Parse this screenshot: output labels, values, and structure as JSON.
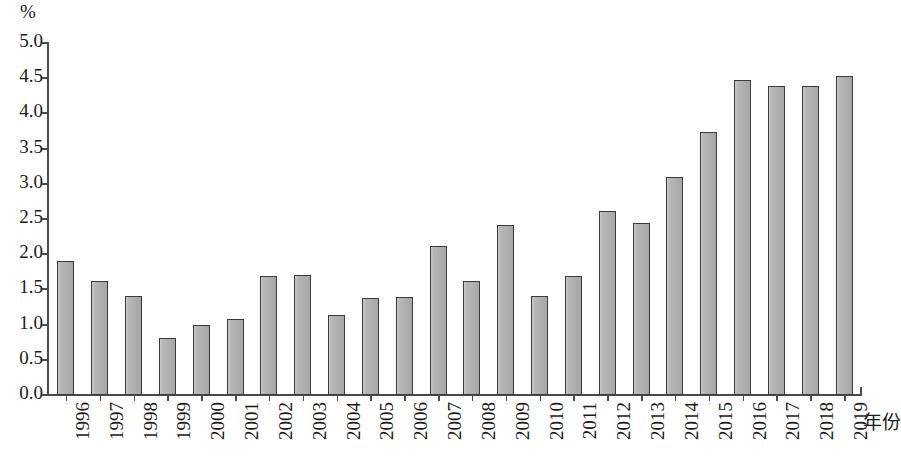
{
  "chart_data": {
    "type": "bar",
    "title": "",
    "subtitle": "",
    "unit_label": "%",
    "xlabel": "年份",
    "ylabel": "%",
    "ylim": [
      0.0,
      5.0
    ],
    "ytick_step": 0.5,
    "grid": false,
    "legend": null,
    "bar_color": "#b3b3b3",
    "bar_border_color": "#3a3a3a",
    "axis_color": "#4a4a4a",
    "ytick_labels": [
      "5.0",
      "4.5",
      "4.0",
      "3.5",
      "3.0",
      "2.5",
      "2.0",
      "1.5",
      "1.0",
      "0.5",
      "0.0"
    ],
    "ytick_values": [
      5.0,
      4.5,
      4.0,
      3.5,
      3.0,
      2.5,
      2.0,
      1.5,
      1.0,
      0.5,
      0.0
    ],
    "categories": [
      "1996",
      "1997",
      "1998",
      "1999",
      "2000",
      "2001",
      "2002",
      "2003",
      "2004",
      "2005",
      "2006",
      "2007",
      "2008",
      "2009",
      "2010",
      "2011",
      "2012",
      "2013",
      "2014",
      "2015",
      "2016",
      "2017",
      "2018",
      "2019"
    ],
    "values": [
      1.91,
      1.62,
      1.4,
      0.81,
      1.0,
      1.08,
      1.69,
      1.7,
      1.14,
      1.38,
      1.39,
      2.12,
      1.62,
      2.41,
      1.4,
      1.69,
      2.61,
      2.45,
      3.1,
      3.74,
      4.47,
      4.39,
      4.39,
      4.53
    ]
  }
}
